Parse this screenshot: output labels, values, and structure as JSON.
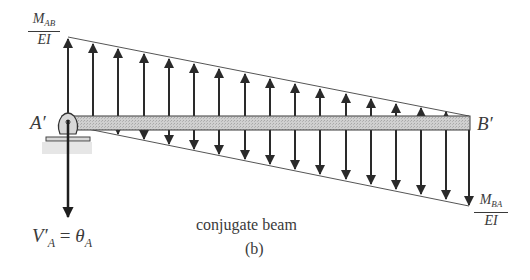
{
  "figure": {
    "caption": "conjugate beam",
    "sublabel": "(b)"
  },
  "labels": {
    "left_end": "A′",
    "right_end": "B′",
    "left_moment": {
      "numerator": "M",
      "subscript": "AB",
      "denominator": "EI"
    },
    "right_moment": {
      "numerator": "M",
      "subscript": "BA",
      "denominator": "EI"
    },
    "reaction": {
      "lhs": "V′",
      "lhs_sub": "A",
      "eq": " = ",
      "rhs": "θ",
      "rhs_sub": "A"
    }
  },
  "colors": {
    "beam_fill": "#c8c8c8",
    "stroke": "#2a2a2a",
    "text": "#3a3a3a"
  }
}
